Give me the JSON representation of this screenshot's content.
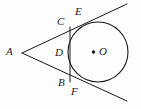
{
  "figure": {
    "kind": "circle-tangent-geometry-diagram",
    "width": 141,
    "height": 109,
    "background_color": "#fdfdfd",
    "stroke_color": "#1a1a1a",
    "label_color": "#1a1a1a"
  },
  "circle": {
    "center_x": 98,
    "center_y": 52,
    "radius": 30,
    "center_dot_radius": 1.6,
    "center_label": "O"
  },
  "points": {
    "a": {
      "label": "A",
      "x": 22,
      "y": 53,
      "label_x": 6,
      "label_y": 46
    },
    "b": {
      "label": "B",
      "x": 70,
      "y": 82,
      "label_x": 58,
      "label_y": 77
    },
    "c": {
      "label": "C",
      "x": 70,
      "y": 27,
      "label_x": 57,
      "label_y": 16
    },
    "d": {
      "label": "D",
      "x": 70,
      "y": 53,
      "label_x": 55,
      "label_y": 47
    },
    "e": {
      "label": "E",
      "x": 86,
      "y": 23,
      "label_x": 75,
      "label_y": 6
    },
    "f": {
      "label": "F",
      "x": 83,
      "y": 83,
      "label_x": 71,
      "label_y": 86
    },
    "o": {
      "label": "O",
      "x": 98,
      "y": 52,
      "label_x": 99,
      "label_y": 46
    }
  },
  "segments": [
    {
      "name": "tangent-line-upper",
      "from_x": 22,
      "from_y": 53,
      "to_x": 127,
      "to_y": 4
    },
    {
      "name": "tangent-line-lower",
      "from_x": 22,
      "from_y": 53,
      "to_x": 127,
      "to_y": 101
    },
    {
      "name": "chord-cb",
      "from_x": 70,
      "from_y": 27,
      "to_x": 70,
      "to_y": 82
    }
  ],
  "labels_order": [
    "A",
    "C",
    "E",
    "D",
    "O",
    "B",
    "F"
  ]
}
